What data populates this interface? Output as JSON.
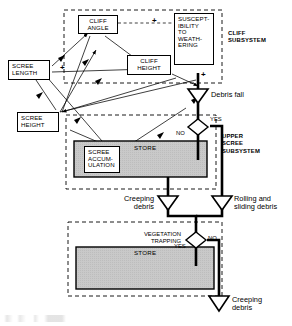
{
  "diagram": {
    "type": "systems-flow-diagram",
    "colors": {
      "line": "#000000",
      "store_fill": "#c9c9c9",
      "background": "#ffffff",
      "dashed_boundary": "#000000"
    }
  },
  "nodes": {
    "cliff_angle": "CLIFF\nANGLE",
    "susceptibility": "SUSCEPT-\nIBILITY\nTO\nWEATH-\nERING",
    "scree_length": "SCREE\nLENGTH",
    "cliff_height": "CLIFF\nHEIGHT",
    "scree_height": "SCREE\nHEIGHT",
    "scree_accumulation": "SCREE\nACCUM-\nULATION"
  },
  "subsystems": [
    {
      "id": "cliff",
      "label": "CLIFF\nSUBSYSTEM"
    },
    {
      "id": "upper_scree",
      "label": "UPPER\nSCREE\nSUBSYSTEM"
    }
  ],
  "stores": [
    {
      "id": "upper-store",
      "label": "STORE"
    },
    {
      "id": "lower-store",
      "label": "STORE"
    }
  ],
  "flows": [
    {
      "id": "debris-fall",
      "label": "Debris  fall"
    },
    {
      "id": "creeping-debris-mid",
      "label": "Creeping\ndebris"
    },
    {
      "id": "rolling-sliding-debris",
      "label": "Rolling and\nsliding debris"
    },
    {
      "id": "creeping-debris-bottom",
      "label": "Creeping\ndebris"
    }
  ],
  "decisions": [
    {
      "id": "upper-decision",
      "yes": "YES",
      "no": "NO"
    },
    {
      "id": "vegetation-decision",
      "question": "VEGETATION\nTRAPPING",
      "yes": "YES",
      "no": "NO"
    }
  ],
  "signs": {
    "cliff_angle_to_susceptibility": "+",
    "scree_length_to_cliff_height": "+",
    "susceptibility_to_debris_fall": "+"
  }
}
